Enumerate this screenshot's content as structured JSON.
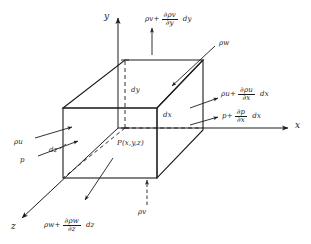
{
  "figure": {
    "background_color": "#ffffff",
    "line_color": "#1c1c1c"
  },
  "axes": {
    "x_label": "x",
    "y_label": "y",
    "z_label": "z"
  },
  "point": {
    "label": "P(x,y,z)"
  },
  "dimensions": {
    "dx": "dx",
    "dy": "dy",
    "dz": "dz"
  },
  "flux_labels": {
    "top": {
      "base": "ρv",
      "operator": "+",
      "numerator": "∂ρv",
      "denominator": "∂y",
      "differential": "dy"
    },
    "right_upper": {
      "base": "ρu",
      "operator": "+",
      "numerator": "∂ρu",
      "denominator": "∂x",
      "differential": "dx"
    },
    "right_lower": {
      "base": "p",
      "operator": "+",
      "numerator": "∂p",
      "denominator": "∂x",
      "differential": "dx"
    },
    "bottom": {
      "base": "ρw",
      "operator": "+",
      "numerator": "∂ρw",
      "denominator": "∂z",
      "differential": "dz"
    },
    "left_upper": {
      "base": "ρu"
    },
    "left_lower": {
      "base": "p"
    },
    "inflow_top_right": {
      "base": "ρw"
    },
    "inflow_bottom": {
      "base": "ρv"
    }
  }
}
